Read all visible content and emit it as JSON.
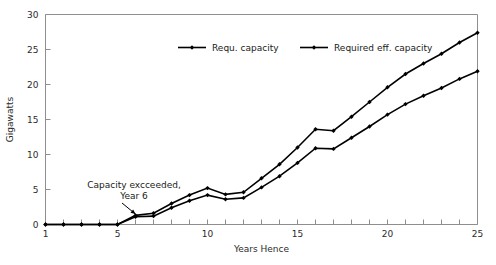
{
  "chart_data": {
    "type": "line",
    "title": "",
    "xlabel": "Years Hence",
    "ylabel": "Gigawatts",
    "xlim": [
      1,
      25
    ],
    "ylim": [
      0,
      30
    ],
    "grid": false,
    "legend_position": "top-center",
    "x_ticks": [
      1,
      5,
      10,
      15,
      20,
      25
    ],
    "x_tick_labels": [
      "1",
      "5",
      "10",
      "15",
      "20",
      "25"
    ],
    "x_minor_ticks": [
      2,
      3,
      4,
      6,
      7,
      8,
      9,
      11,
      12,
      13,
      14,
      16,
      17,
      18,
      19,
      21,
      22,
      23,
      24
    ],
    "y_ticks": [
      0,
      5,
      10,
      15,
      20,
      25,
      30
    ],
    "y_tick_labels": [
      "0",
      "5",
      "10",
      "15",
      "20",
      "25",
      "30"
    ],
    "x": [
      1,
      2,
      3,
      4,
      5,
      6,
      7,
      8,
      9,
      10,
      11,
      12,
      13,
      14,
      15,
      16,
      17,
      18,
      19,
      20,
      21,
      22,
      23,
      24,
      25
    ],
    "series": [
      {
        "name": "Requ. capacity",
        "marker": "diamond",
        "color": "#000000",
        "values": [
          0,
          0,
          0,
          0,
          0,
          1.3,
          1.6,
          3.0,
          4.2,
          5.2,
          4.3,
          4.6,
          6.6,
          8.6,
          11.0,
          13.6,
          13.4,
          15.4,
          17.5,
          19.6,
          21.5,
          23.0,
          24.4,
          26.0,
          27.4
        ]
      },
      {
        "name": "Required eff. capacity",
        "marker": "diamond",
        "color": "#000000",
        "values": [
          0,
          0,
          0,
          0,
          0,
          1.1,
          1.2,
          2.4,
          3.4,
          4.2,
          3.6,
          3.8,
          5.3,
          6.9,
          8.8,
          10.9,
          10.8,
          12.4,
          14.0,
          15.7,
          17.2,
          18.4,
          19.5,
          20.8,
          21.9
        ]
      }
    ],
    "annotations": [
      {
        "name": "capacity-exceeded-note",
        "text_line_1": "Capacity excceeded,",
        "text_line_2": "Year 6",
        "points_to_x": 6,
        "points_to_y": 1.2
      }
    ]
  },
  "legend": {
    "entries": [
      {
        "label": "Requ. capacity"
      },
      {
        "label": "Required eff. capacity"
      }
    ]
  }
}
